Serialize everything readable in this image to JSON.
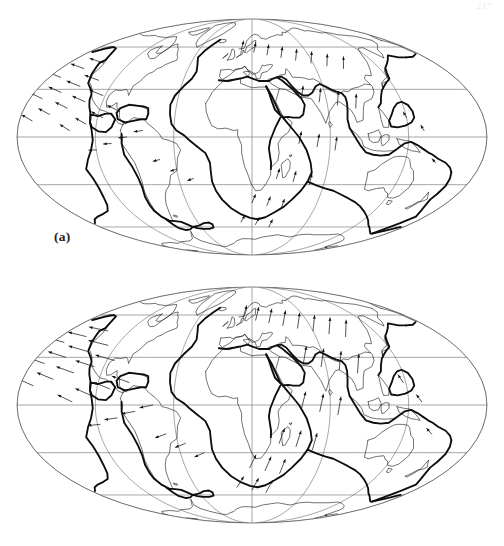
{
  "page": {
    "page_number": "217",
    "background_color": "#ffffff",
    "width": 504,
    "height": 546
  },
  "figure": {
    "type": "two-panel-map-figure",
    "panels": [
      {
        "id": "a",
        "label": "(a)",
        "projection": "Mollweide (equal-area elliptical)",
        "center_longitude_deg": 20,
        "graticule": {
          "meridian_spacing_deg": 60,
          "parallel_spacing_deg": 30,
          "meridians_deg": [
            -160,
            -100,
            -40,
            20,
            80,
            140,
            200
          ],
          "parallels_deg": [
            -60,
            -30,
            0,
            30,
            60
          ],
          "outline_color": "#5a5a5a",
          "line_color": "#6e6e6e"
        },
        "layers": [
          {
            "name": "coastlines",
            "style": "thin-black",
            "color": "#1c1c1c"
          },
          {
            "name": "plate-boundaries",
            "style": "thick-black",
            "color": "#0d0d0d"
          },
          {
            "name": "velocity-vectors",
            "style": "arrows",
            "color": "#111111"
          }
        ]
      },
      {
        "id": "b",
        "label": "(b)",
        "projection": "Mollweide (equal-area elliptical)",
        "center_longitude_deg": 20,
        "graticule": {
          "meridian_spacing_deg": 60,
          "parallel_spacing_deg": 30,
          "meridians_deg": [
            -160,
            -100,
            -40,
            20,
            80,
            140,
            200
          ],
          "parallels_deg": [
            -60,
            -30,
            0,
            30,
            60
          ],
          "outline_color": "#5a5a5a",
          "line_color": "#6e6e6e"
        },
        "layers": [
          {
            "name": "coastlines",
            "style": "thin-black",
            "color": "#1c1c1c"
          },
          {
            "name": "plate-boundaries",
            "style": "thick-black",
            "color": "#0d0d0d"
          },
          {
            "name": "velocity-vectors",
            "style": "arrows",
            "color": "#111111"
          }
        ]
      }
    ]
  },
  "chart_data": {
    "type": "map",
    "title": "",
    "subtitle": "",
    "projection": "Mollweide",
    "panels": [
      {
        "label": "(a)",
        "description": "Global plate-motion velocity field, model a",
        "vector_field_note": "Arrow length proportional to plate velocity; arrows drawn at regular grid nodes over oceanic and continental plates.",
        "vectors": [
          {
            "lon": -150,
            "lat": 38,
            "az": 292,
            "mag": 0.72
          },
          {
            "lon": -138,
            "lat": 44,
            "az": 290,
            "mag": 0.8
          },
          {
            "lon": -126,
            "lat": 48,
            "az": 288,
            "mag": 0.85
          },
          {
            "lon": -150,
            "lat": 24,
            "az": 296,
            "mag": 0.74
          },
          {
            "lon": -138,
            "lat": 28,
            "az": 294,
            "mag": 0.78
          },
          {
            "lon": -126,
            "lat": 32,
            "az": 292,
            "mag": 0.82
          },
          {
            "lon": -114,
            "lat": 36,
            "az": 290,
            "mag": 0.86
          },
          {
            "lon": -150,
            "lat": 10,
            "az": 300,
            "mag": 0.7
          },
          {
            "lon": -138,
            "lat": 14,
            "az": 298,
            "mag": 0.72
          },
          {
            "lon": -126,
            "lat": 18,
            "az": 296,
            "mag": 0.76
          },
          {
            "lon": -114,
            "lat": 22,
            "az": 294,
            "mag": 0.8
          },
          {
            "lon": -102,
            "lat": 26,
            "az": 292,
            "mag": 0.84
          },
          {
            "lon": -120,
            "lat": 4,
            "az": 302,
            "mag": 0.66
          },
          {
            "lon": -108,
            "lat": 8,
            "az": 300,
            "mag": 0.7
          },
          {
            "lon": -96,
            "lat": 12,
            "az": 298,
            "mag": 0.74
          },
          {
            "lon": -84,
            "lat": 16,
            "az": 296,
            "mag": 0.78
          },
          {
            "lon": -100,
            "lat": -8,
            "az": 268,
            "mag": 0.44
          },
          {
            "lon": -88,
            "lat": -4,
            "az": 266,
            "mag": 0.46
          },
          {
            "lon": -76,
            "lat": 0,
            "az": 264,
            "mag": 0.48
          },
          {
            "lon": -64,
            "lat": 4,
            "az": 262,
            "mag": 0.5
          },
          {
            "lon": -52,
            "lat": -14,
            "az": 256,
            "mag": 0.4
          },
          {
            "lon": -40,
            "lat": -20,
            "az": 252,
            "mag": 0.38
          },
          {
            "lon": -28,
            "lat": -26,
            "az": 250,
            "mag": 0.36
          },
          {
            "lon": 8,
            "lat": 58,
            "az": 14,
            "mag": 0.52
          },
          {
            "lon": 22,
            "lat": 56,
            "az": 12,
            "mag": 0.56
          },
          {
            "lon": 36,
            "lat": 54,
            "az": 10,
            "mag": 0.6
          },
          {
            "lon": 50,
            "lat": 52,
            "az": 8,
            "mag": 0.62
          },
          {
            "lon": 64,
            "lat": 50,
            "az": 6,
            "mag": 0.64
          },
          {
            "lon": 78,
            "lat": 48,
            "az": 4,
            "mag": 0.66
          },
          {
            "lon": 92,
            "lat": 46,
            "az": 2,
            "mag": 0.68
          },
          {
            "lon": 106,
            "lat": 44,
            "az": 0,
            "mag": 0.7
          },
          {
            "lon": 60,
            "lat": 24,
            "az": 8,
            "mag": 0.74
          },
          {
            "lon": 74,
            "lat": 22,
            "az": 6,
            "mag": 0.78
          },
          {
            "lon": 88,
            "lat": 20,
            "az": 4,
            "mag": 0.8
          },
          {
            "lon": 102,
            "lat": 18,
            "az": 2,
            "mag": 0.82
          },
          {
            "lon": 56,
            "lat": -4,
            "az": 12,
            "mag": 0.7
          },
          {
            "lon": 70,
            "lat": -6,
            "az": 10,
            "mag": 0.74
          },
          {
            "lon": 84,
            "lat": -8,
            "az": 8,
            "mag": 0.76
          },
          {
            "lon": 40,
            "lat": -26,
            "az": 18,
            "mag": 0.6
          },
          {
            "lon": 54,
            "lat": -28,
            "az": 16,
            "mag": 0.62
          },
          {
            "lon": 68,
            "lat": -30,
            "az": 14,
            "mag": 0.64
          },
          {
            "lon": 20,
            "lat": -42,
            "az": 24,
            "mag": 0.52
          },
          {
            "lon": 34,
            "lat": -44,
            "az": 22,
            "mag": 0.54
          },
          {
            "lon": 48,
            "lat": -46,
            "az": 20,
            "mag": 0.56
          },
          {
            "lon": 8,
            "lat": -56,
            "az": 30,
            "mag": 0.44
          },
          {
            "lon": 24,
            "lat": -58,
            "az": 28,
            "mag": 0.46
          },
          {
            "lon": 40,
            "lat": -60,
            "az": 26,
            "mag": 0.48
          },
          {
            "lon": 140,
            "lat": 12,
            "az": 330,
            "mag": 0.38
          },
          {
            "lon": 152,
            "lat": 4,
            "az": 328,
            "mag": 0.36
          },
          {
            "lon": 164,
            "lat": -16,
            "az": 320,
            "mag": 0.3
          }
        ]
      },
      {
        "label": "(b)",
        "description": "Global plate-motion velocity field, model b",
        "vector_field_note": "Arrow length proportional to plate velocity; denser sampling than panel (a), larger southern-hemisphere magnitudes.",
        "vectors": [
          {
            "lon": -150,
            "lat": 40,
            "az": 286,
            "mag": 0.84
          },
          {
            "lon": -136,
            "lat": 44,
            "az": 284,
            "mag": 0.9
          },
          {
            "lon": -122,
            "lat": 48,
            "az": 282,
            "mag": 0.94
          },
          {
            "lon": -150,
            "lat": 26,
            "az": 290,
            "mag": 0.86
          },
          {
            "lon": -136,
            "lat": 30,
            "az": 288,
            "mag": 0.9
          },
          {
            "lon": -122,
            "lat": 34,
            "az": 286,
            "mag": 0.94
          },
          {
            "lon": -108,
            "lat": 38,
            "az": 284,
            "mag": 0.98
          },
          {
            "lon": -150,
            "lat": 12,
            "az": 294,
            "mag": 0.82
          },
          {
            "lon": -136,
            "lat": 16,
            "az": 292,
            "mag": 0.86
          },
          {
            "lon": -122,
            "lat": 20,
            "az": 290,
            "mag": 0.9
          },
          {
            "lon": -108,
            "lat": 24,
            "az": 288,
            "mag": 0.94
          },
          {
            "lon": -94,
            "lat": 28,
            "az": 286,
            "mag": 0.96
          },
          {
            "lon": -118,
            "lat": 2,
            "az": 296,
            "mag": 0.78
          },
          {
            "lon": -104,
            "lat": 6,
            "az": 294,
            "mag": 0.82
          },
          {
            "lon": -90,
            "lat": 10,
            "az": 292,
            "mag": 0.86
          },
          {
            "lon": -76,
            "lat": 14,
            "az": 290,
            "mag": 0.9
          },
          {
            "lon": -98,
            "lat": -12,
            "az": 264,
            "mag": 0.6
          },
          {
            "lon": -84,
            "lat": -8,
            "az": 262,
            "mag": 0.62
          },
          {
            "lon": -70,
            "lat": -4,
            "az": 260,
            "mag": 0.64
          },
          {
            "lon": -56,
            "lat": 0,
            "az": 258,
            "mag": 0.66
          },
          {
            "lon": -48,
            "lat": -18,
            "az": 250,
            "mag": 0.56
          },
          {
            "lon": -34,
            "lat": -24,
            "az": 248,
            "mag": 0.54
          },
          {
            "lon": -20,
            "lat": -30,
            "az": 246,
            "mag": 0.52
          },
          {
            "lon": 10,
            "lat": 58,
            "az": 16,
            "mag": 0.62
          },
          {
            "lon": 24,
            "lat": 56,
            "az": 14,
            "mag": 0.66
          },
          {
            "lon": 38,
            "lat": 54,
            "az": 12,
            "mag": 0.7
          },
          {
            "lon": 52,
            "lat": 52,
            "az": 10,
            "mag": 0.74
          },
          {
            "lon": 66,
            "lat": 50,
            "az": 8,
            "mag": 0.76
          },
          {
            "lon": 80,
            "lat": 48,
            "az": 6,
            "mag": 0.78
          },
          {
            "lon": 94,
            "lat": 46,
            "az": 4,
            "mag": 0.8
          },
          {
            "lon": 108,
            "lat": 44,
            "az": 2,
            "mag": 0.82
          },
          {
            "lon": 62,
            "lat": 26,
            "az": 10,
            "mag": 0.86
          },
          {
            "lon": 76,
            "lat": 24,
            "az": 8,
            "mag": 0.9
          },
          {
            "lon": 90,
            "lat": 22,
            "az": 6,
            "mag": 0.92
          },
          {
            "lon": 104,
            "lat": 20,
            "az": 4,
            "mag": 0.94
          },
          {
            "lon": 58,
            "lat": -2,
            "az": 14,
            "mag": 0.84
          },
          {
            "lon": 72,
            "lat": -4,
            "az": 12,
            "mag": 0.88
          },
          {
            "lon": 86,
            "lat": -6,
            "az": 10,
            "mag": 0.9
          },
          {
            "lon": 42,
            "lat": -24,
            "az": 20,
            "mag": 0.78
          },
          {
            "lon": 56,
            "lat": -26,
            "az": 18,
            "mag": 0.82
          },
          {
            "lon": 70,
            "lat": -28,
            "az": 16,
            "mag": 0.84
          },
          {
            "lon": 18,
            "lat": -40,
            "az": 26,
            "mag": 0.7
          },
          {
            "lon": 32,
            "lat": -42,
            "az": 24,
            "mag": 0.74
          },
          {
            "lon": 46,
            "lat": -44,
            "az": 22,
            "mag": 0.76
          },
          {
            "lon": 4,
            "lat": -54,
            "az": 32,
            "mag": 0.62
          },
          {
            "lon": 20,
            "lat": -56,
            "az": 30,
            "mag": 0.66
          },
          {
            "lon": 36,
            "lat": -58,
            "az": 28,
            "mag": 0.68
          },
          {
            "lon": 138,
            "lat": 14,
            "az": 326,
            "mag": 0.46
          },
          {
            "lon": 150,
            "lat": 2,
            "az": 324,
            "mag": 0.44
          },
          {
            "lon": 162,
            "lat": -18,
            "az": 318,
            "mag": 0.38
          }
        ]
      }
    ],
    "plate_boundaries": [
      "Mid-Atlantic Ridge",
      "East Pacific Rise",
      "Southwest Indian Ridge",
      "Southeast Indian Ridge",
      "Pacific-Antarctic Ridge",
      "Nazca-South America trench",
      "Eurasia-Africa collision belt",
      "Indo-Australian northern boundary"
    ],
    "grid": true,
    "legend": "none"
  }
}
